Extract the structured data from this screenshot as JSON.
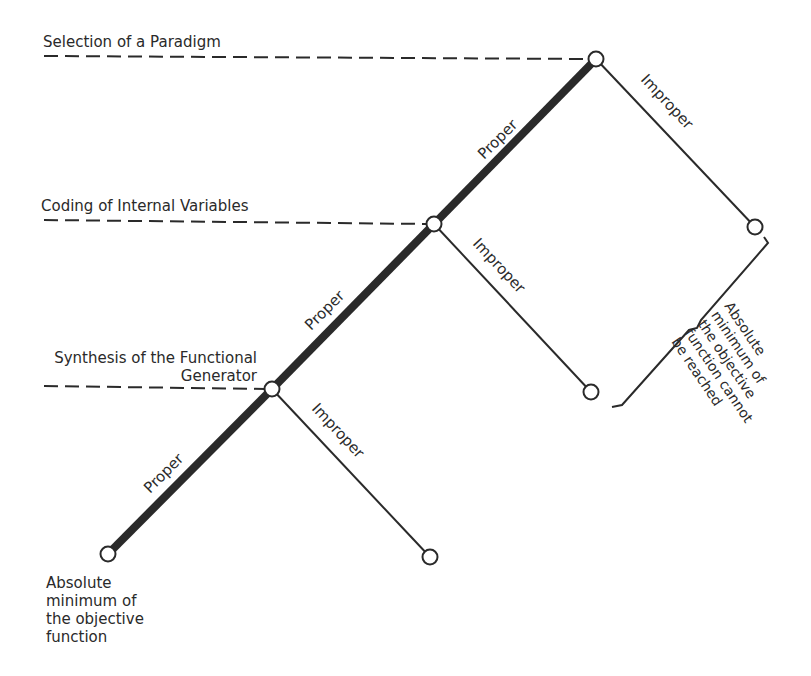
{
  "diagram": {
    "levels": [
      {
        "label": "Selection of a Paradigm"
      },
      {
        "label": "Coding of Internal Variables"
      },
      {
        "label_line1": "Synthesis of the Functional",
        "label_line2": "Generator"
      }
    ],
    "branch_labels": {
      "proper": "Proper",
      "improper": "Improper"
    },
    "goal_label": [
      "Absolute",
      "minimum of",
      "the objective",
      "function"
    ],
    "brace_label": [
      "Absolute",
      "minimum of",
      "the objective",
      "function cannot",
      "be reached"
    ],
    "colors": {
      "line": "#2a2a2a",
      "background": "#ffffff"
    }
  }
}
